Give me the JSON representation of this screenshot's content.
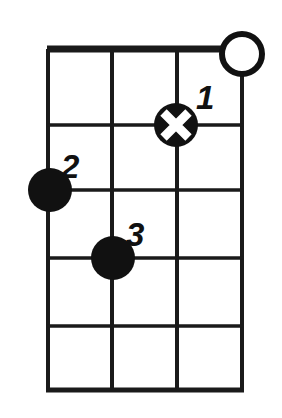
{
  "diagram": {
    "instrument_strings": 4,
    "fret_count": 5,
    "background_color": "#ffffff",
    "line_color": "#1a1a1a",
    "dot_color": "#111111",
    "x_mark_color": "#ffffff"
  },
  "geometry": {
    "board_left": 48,
    "board_right": 242,
    "board_top": 49,
    "board_bottom": 391,
    "string_x": [
      48,
      112,
      177,
      242
    ],
    "fret_y": [
      49,
      125,
      190,
      258,
      326,
      391
    ],
    "nut_thickness": 6,
    "grid_thickness": 3,
    "dot_radius": 22,
    "open_circle_radius": 20,
    "open_circle_stroke": 5
  },
  "markers": {
    "open_strings": [
      {
        "name": "open-string-4",
        "string": 4,
        "cx": 242,
        "cy": 54,
        "r": 20,
        "symbol": "open-circle"
      }
    ],
    "fingers": [
      {
        "name": "finger-1",
        "label": "1",
        "string": 3,
        "fret": 1,
        "cx": 176,
        "cy": 125,
        "r": 22,
        "symbol": "x-dot",
        "label_x": 196,
        "label_y": 109
      },
      {
        "name": "finger-2",
        "label": "2",
        "string": 1,
        "fret": 2,
        "cx": 50,
        "cy": 190,
        "r": 22,
        "symbol": "filled-dot",
        "label_x": 61,
        "label_y": 178
      },
      {
        "name": "finger-3",
        "label": "3",
        "string": 2,
        "fret": 3,
        "cx": 113,
        "cy": 258,
        "r": 22,
        "symbol": "filled-dot",
        "label_x": 126,
        "label_y": 246
      }
    ]
  },
  "labels": {
    "finger_1": "1",
    "finger_2": "2",
    "finger_3": "3"
  }
}
